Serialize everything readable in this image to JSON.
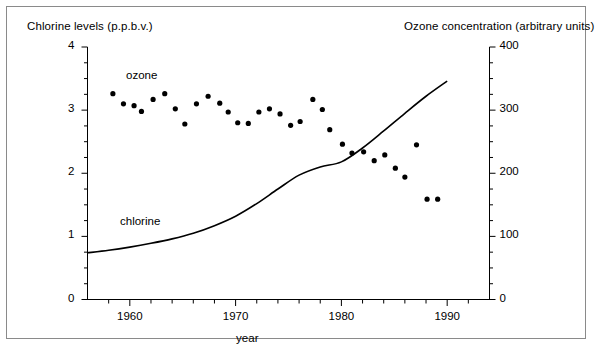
{
  "figure": {
    "background": "#ffffff",
    "frame_color": "#8a8a8a",
    "ink_color": "#000000"
  },
  "chart_data": {
    "type": "scatter",
    "title": "",
    "xlabel": "year",
    "ylabel": "Chlorine levels (p.p.b.v.)",
    "y2label": "Ozone concentration (arbitrary units)",
    "xlim": [
      1956,
      1994
    ],
    "ylim": [
      0,
      4
    ],
    "y2lim": [
      0,
      400
    ],
    "grid": false,
    "legend_position": "inline-annotation",
    "xticks": [
      1960,
      1970,
      1980,
      1990
    ],
    "xtick_labels": [
      "1960",
      "1970",
      "1980",
      "1990"
    ],
    "xtick_minor_step": 2,
    "yticks": [
      0,
      1,
      2,
      3,
      4
    ],
    "ytick_labels": [
      "0",
      "1",
      "2",
      "3",
      "4"
    ],
    "ytick_minor_step": 0.25,
    "y2ticks": [
      0,
      100,
      200,
      300,
      400
    ],
    "y2tick_labels": [
      "0",
      "100",
      "200",
      "300",
      "400"
    ],
    "y2tick_minor_step": 25,
    "series": [
      {
        "name": "ozone",
        "label": "ozone",
        "type": "scatter",
        "axis": "right",
        "marker": "filled-circle",
        "x": [
          1958.4,
          1959.4,
          1960.4,
          1961.1,
          1962.2,
          1963.3,
          1964.3,
          1965.2,
          1966.3,
          1967.4,
          1968.5,
          1969.3,
          1970.2,
          1971.2,
          1972.2,
          1973.2,
          1974.2,
          1975.2,
          1976.1,
          1977.3,
          1978.2,
          1978.9,
          1980.1,
          1981.0,
          1982.1,
          1983.1,
          1984.1,
          1985.1,
          1986.0,
          1987.1,
          1988.1,
          1989.1
        ],
        "y": [
          326,
          310,
          307,
          298,
          317,
          326,
          302,
          278,
          310,
          322,
          311,
          297,
          280,
          279,
          297,
          302,
          294,
          276,
          282,
          317,
          301,
          269,
          246,
          232,
          234,
          220,
          229,
          208,
          194,
          245,
          159,
          159
        ],
        "y_units": "arbitrary units"
      },
      {
        "name": "chlorine",
        "label": "chlorine",
        "type": "line",
        "axis": "left",
        "x": [
          1956.0,
          1958.0,
          1960.0,
          1962.0,
          1964.0,
          1966.0,
          1968.0,
          1970.0,
          1972.0,
          1974.0,
          1976.0,
          1978.0,
          1980.0,
          1982.0,
          1984.0,
          1986.0,
          1988.0,
          1990.0
        ],
        "y": [
          0.74,
          0.78,
          0.83,
          0.89,
          0.96,
          1.05,
          1.17,
          1.32,
          1.52,
          1.75,
          1.97,
          2.1,
          2.18,
          2.4,
          2.67,
          2.95,
          3.22,
          3.46
        ],
        "y_units": "p.p.b.v."
      }
    ]
  },
  "annotations": {
    "ozone_label": "ozone",
    "chlorine_label": "chlorine"
  },
  "axes": {
    "left_title": "Chlorine levels (p.p.b.v.)",
    "right_title": "Ozone concentration (arbitrary units)",
    "bottom_title": "year"
  }
}
